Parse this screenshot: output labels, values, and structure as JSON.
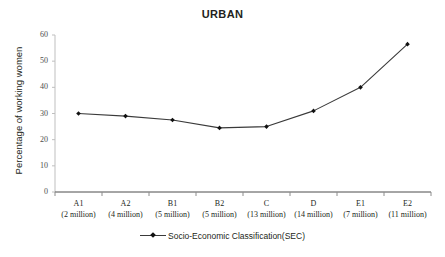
{
  "chart_data": {
    "type": "line",
    "title": "URBAN",
    "xlabel": "",
    "ylabel": "Percentage of working women",
    "ylim": [
      0,
      60
    ],
    "ytick_step": 10,
    "yticks": [
      "0",
      "10",
      "20",
      "30",
      "40",
      "50",
      "60"
    ],
    "grid": false,
    "legend_position": "bottom",
    "categories": [
      "A1 (2 million)",
      "A2 (4 million)",
      "B1 (5 million)",
      "B2 (5 million)",
      "C (13 million)",
      "D (14 million)",
      "E1 (7 million)",
      "E2 (11 million)"
    ],
    "category_codes": [
      "A1",
      "A2",
      "B1",
      "B2",
      "C",
      "D",
      "E1",
      "E2"
    ],
    "category_populations": [
      "(2 million)",
      "(4 million)",
      "(5 million)",
      "(5 million)",
      "(13 million)",
      "(14 million)",
      "(7 million)",
      "(11 million)"
    ],
    "series": [
      {
        "name": "Socio-Economic Classification(SEC)",
        "values": [
          30,
          29,
          27.5,
          24.5,
          25,
          31,
          40,
          56.5
        ]
      }
    ],
    "line_color": "#3a3a3a",
    "marker_color": "#111111",
    "axis_color": "#bfbfbf",
    "text_color": "#231f20"
  },
  "legend": {
    "label": "Socio-Economic Classification(SEC)"
  }
}
